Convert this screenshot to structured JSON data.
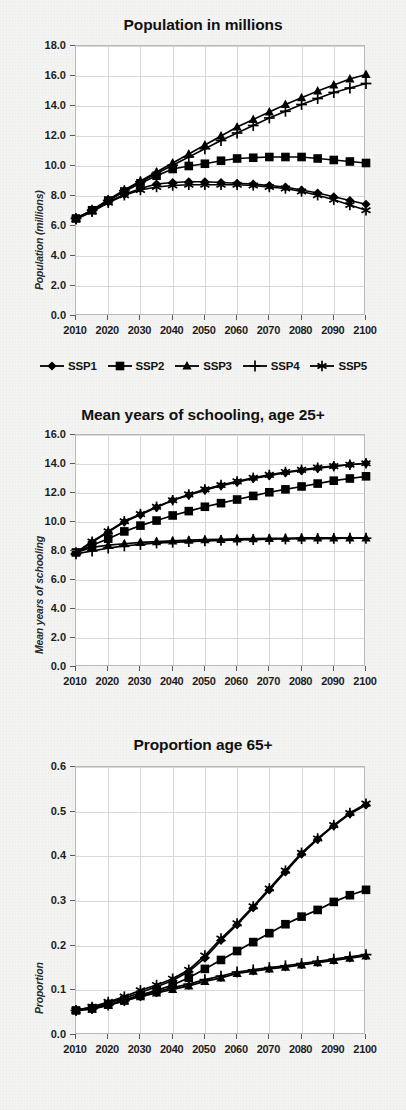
{
  "figure": {
    "background_color": "#f4f4f3",
    "plot_background_color": "#ffffff",
    "grid_color": "#d9d9d9",
    "series_color": "#000000"
  },
  "legend": {
    "position": "below-first-chart",
    "entries": [
      {
        "label": "SSP1",
        "marker": "diamond-marker"
      },
      {
        "label": "SSP2",
        "marker": "square-marker"
      },
      {
        "label": "SSP3",
        "marker": "triangle-marker"
      },
      {
        "label": "SSP4",
        "marker": "plus-marker"
      },
      {
        "label": "SSP5",
        "marker": "asterisk-marker"
      }
    ]
  },
  "chart_data": [
    {
      "type": "line",
      "title": "Population in millions",
      "xlabel": "",
      "ylabel": "Population (millions)",
      "grid": true,
      "legend_position": "bottom",
      "x": [
        2010,
        2015,
        2020,
        2025,
        2030,
        2035,
        2040,
        2045,
        2050,
        2055,
        2060,
        2065,
        2070,
        2075,
        2080,
        2085,
        2090,
        2095,
        2100
      ],
      "xlim": [
        2010,
        2100
      ],
      "ylim": [
        0.0,
        18.0
      ],
      "ytick_labels": [
        "0.0",
        "2.0",
        "4.0",
        "6.0",
        "8.0",
        "10.0",
        "12.0",
        "14.0",
        "16.0",
        "18.0"
      ],
      "ytick_values": [
        0.0,
        2.0,
        4.0,
        6.0,
        8.0,
        10.0,
        12.0,
        14.0,
        16.0,
        18.0
      ],
      "xtick_labels": [
        "2010",
        "2020",
        "2030",
        "2040",
        "2050",
        "2060",
        "2070",
        "2080",
        "2090",
        "2100"
      ],
      "xtick_values": [
        2010,
        2020,
        2030,
        2040,
        2050,
        2060,
        2070,
        2080,
        2090,
        2100
      ],
      "series": [
        {
          "name": "SSP1",
          "marker": "diamond-marker",
          "values": [
            6.5,
            7.0,
            7.6,
            8.1,
            8.5,
            8.8,
            8.9,
            8.95,
            8.95,
            8.9,
            8.85,
            8.8,
            8.7,
            8.6,
            8.4,
            8.2,
            7.95,
            7.7,
            7.45
          ]
        },
        {
          "name": "SSP2",
          "marker": "square-marker",
          "values": [
            6.5,
            7.05,
            7.7,
            8.3,
            8.85,
            9.35,
            9.8,
            10.0,
            10.15,
            10.35,
            10.5,
            10.55,
            10.6,
            10.6,
            10.6,
            10.5,
            10.4,
            10.3,
            10.2
          ]
        },
        {
          "name": "SSP3",
          "marker": "triangle-marker",
          "values": [
            6.5,
            7.05,
            7.75,
            8.4,
            9.0,
            9.6,
            10.2,
            10.8,
            11.4,
            12.0,
            12.6,
            13.1,
            13.6,
            14.1,
            14.55,
            15.0,
            15.4,
            15.8,
            16.1
          ]
        },
        {
          "name": "SSP4",
          "marker": "plus-marker",
          "values": [
            6.5,
            7.05,
            7.7,
            8.35,
            8.95,
            9.5,
            10.05,
            10.6,
            11.15,
            11.7,
            12.2,
            12.7,
            13.2,
            13.65,
            14.1,
            14.5,
            14.9,
            15.2,
            15.5
          ]
        },
        {
          "name": "SSP5",
          "marker": "asterisk-marker",
          "values": [
            6.45,
            6.95,
            7.55,
            8.05,
            8.4,
            8.6,
            8.7,
            8.75,
            8.75,
            8.75,
            8.75,
            8.7,
            8.6,
            8.5,
            8.3,
            8.05,
            7.75,
            7.4,
            7.05
          ]
        }
      ]
    },
    {
      "type": "line",
      "title": "Mean years of schooling, age 25+",
      "xlabel": "",
      "ylabel": "Mean years of schooling",
      "grid": true,
      "legend_position": "none",
      "x": [
        2010,
        2015,
        2020,
        2025,
        2030,
        2035,
        2040,
        2045,
        2050,
        2055,
        2060,
        2065,
        2070,
        2075,
        2080,
        2085,
        2090,
        2095,
        2100
      ],
      "xlim": [
        2010,
        2100
      ],
      "ylim": [
        0.0,
        16.0
      ],
      "ytick_labels": [
        "0.0",
        "2.0",
        "4.0",
        "6.0",
        "8.0",
        "10.0",
        "12.0",
        "14.0",
        "16.0"
      ],
      "ytick_values": [
        0.0,
        2.0,
        4.0,
        6.0,
        8.0,
        10.0,
        12.0,
        14.0,
        16.0
      ],
      "xtick_labels": [
        "2010",
        "2020",
        "2030",
        "2040",
        "2050",
        "2060",
        "2070",
        "2080",
        "2090",
        "2100"
      ],
      "xtick_values": [
        2010,
        2020,
        2030,
        2040,
        2050,
        2060,
        2070,
        2080,
        2090,
        2100
      ],
      "series": [
        {
          "name": "SSP1",
          "marker": "diamond-marker",
          "values": [
            7.9,
            8.6,
            9.3,
            10.0,
            10.5,
            11.0,
            11.5,
            11.85,
            12.2,
            12.5,
            12.75,
            13.0,
            13.2,
            13.4,
            13.55,
            13.7,
            13.85,
            13.95,
            14.05
          ]
        },
        {
          "name": "SSP2",
          "marker": "square-marker",
          "values": [
            7.9,
            8.4,
            8.85,
            9.35,
            9.75,
            10.1,
            10.45,
            10.75,
            11.05,
            11.3,
            11.55,
            11.8,
            12.05,
            12.25,
            12.45,
            12.65,
            12.85,
            13.0,
            13.15
          ]
        },
        {
          "name": "SSP3",
          "marker": "triangle-marker",
          "values": [
            7.9,
            8.25,
            8.4,
            8.5,
            8.6,
            8.65,
            8.7,
            8.75,
            8.78,
            8.8,
            8.83,
            8.85,
            8.87,
            8.88,
            8.9,
            8.9,
            8.9,
            8.9,
            8.9
          ]
        },
        {
          "name": "SSP4",
          "marker": "plus-marker",
          "values": [
            7.8,
            8.0,
            8.2,
            8.35,
            8.45,
            8.55,
            8.6,
            8.65,
            8.7,
            8.73,
            8.76,
            8.79,
            8.81,
            8.83,
            8.85,
            8.86,
            8.87,
            8.88,
            8.88
          ]
        },
        {
          "name": "SSP5",
          "marker": "asterisk-marker",
          "values": [
            7.9,
            8.65,
            9.35,
            10.05,
            10.55,
            11.05,
            11.5,
            11.9,
            12.25,
            12.55,
            12.8,
            13.05,
            13.25,
            13.45,
            13.6,
            13.75,
            13.85,
            13.95,
            14.05
          ]
        }
      ]
    },
    {
      "type": "line",
      "title": "Proportion age 65+",
      "xlabel": "",
      "ylabel": "Proportion",
      "grid": true,
      "legend_position": "none",
      "x": [
        2010,
        2015,
        2020,
        2025,
        2030,
        2035,
        2040,
        2045,
        2050,
        2055,
        2060,
        2065,
        2070,
        2075,
        2080,
        2085,
        2090,
        2095,
        2100
      ],
      "xlim": [
        2010,
        2100
      ],
      "ylim": [
        0.0,
        0.6
      ],
      "ytick_labels": [
        "0.0",
        "0.1",
        "0.2",
        "0.3",
        "0.4",
        "0.5",
        "0.6"
      ],
      "ytick_values": [
        0.0,
        0.1,
        0.2,
        0.3,
        0.4,
        0.5,
        0.6
      ],
      "xtick_labels": [
        "2010",
        "2020",
        "2030",
        "2040",
        "2050",
        "2060",
        "2070",
        "2080",
        "2090",
        "2100"
      ],
      "xtick_values": [
        2010,
        2020,
        2030,
        2040,
        2050,
        2060,
        2070,
        2080,
        2090,
        2100
      ],
      "series": [
        {
          "name": "SSP1",
          "marker": "diamond-marker",
          "values": [
            0.055,
            0.062,
            0.072,
            0.082,
            0.095,
            0.108,
            0.122,
            0.142,
            0.172,
            0.212,
            0.247,
            0.285,
            0.325,
            0.365,
            0.405,
            0.438,
            0.468,
            0.495,
            0.515
          ]
        },
        {
          "name": "SSP2",
          "marker": "square-marker",
          "values": [
            0.055,
            0.06,
            0.068,
            0.078,
            0.09,
            0.1,
            0.112,
            0.128,
            0.148,
            0.168,
            0.188,
            0.208,
            0.228,
            0.248,
            0.265,
            0.28,
            0.298,
            0.313,
            0.325
          ]
        },
        {
          "name": "SSP3",
          "marker": "triangle-marker",
          "values": [
            0.055,
            0.058,
            0.066,
            0.076,
            0.086,
            0.094,
            0.102,
            0.11,
            0.12,
            0.128,
            0.138,
            0.143,
            0.148,
            0.152,
            0.157,
            0.162,
            0.167,
            0.172,
            0.177
          ]
        },
        {
          "name": "SSP4",
          "marker": "plus-marker",
          "values": [
            0.055,
            0.059,
            0.067,
            0.077,
            0.088,
            0.097,
            0.106,
            0.114,
            0.124,
            0.132,
            0.141,
            0.146,
            0.151,
            0.155,
            0.16,
            0.165,
            0.17,
            0.175,
            0.18
          ]
        },
        {
          "name": "SSP5",
          "marker": "asterisk-marker",
          "values": [
            0.055,
            0.063,
            0.074,
            0.086,
            0.1,
            0.112,
            0.126,
            0.146,
            0.178,
            0.216,
            0.25,
            0.288,
            0.328,
            0.368,
            0.408,
            0.44,
            0.47,
            0.497,
            0.518
          ]
        }
      ]
    }
  ]
}
